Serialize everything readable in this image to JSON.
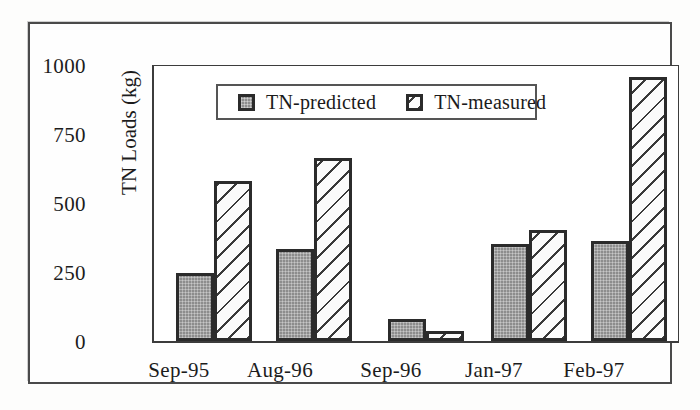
{
  "chart_data": {
    "type": "bar",
    "title": "",
    "xlabel": "",
    "ylabel": "TN Loads (kg)",
    "ylim": [
      0,
      1000
    ],
    "yticks": [
      "0",
      "250",
      "500",
      "750",
      "1000"
    ],
    "grid": false,
    "legend_position": "top-center-inside",
    "categories": [
      "Sep-95",
      "Aug-96",
      "Sep-96",
      "Jan-97",
      "Feb-97"
    ],
    "series": [
      {
        "name": "TN-predicted",
        "fill": "solid-gray",
        "color": "#8d8d8d",
        "values": [
          245,
          330,
          80,
          350,
          360
        ]
      },
      {
        "name": "TN-measured",
        "fill": "diagonal-hatch",
        "color": "#ffffff",
        "values": [
          575,
          660,
          35,
          400,
          950
        ]
      }
    ]
  },
  "legend": {
    "entries": [
      {
        "label": "TN-predicted",
        "swatch": "solid-gray-square-icon"
      },
      {
        "label": "TN-measured",
        "swatch": "hatched-square-icon"
      }
    ]
  }
}
